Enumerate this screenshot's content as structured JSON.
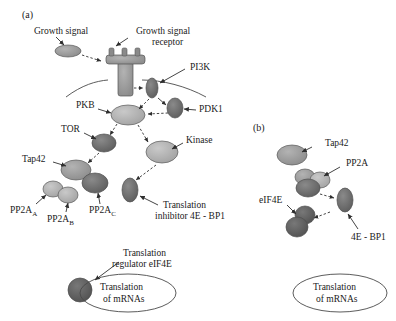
{
  "figure": {
    "type": "signaling-pathway-diagram",
    "panels": [
      {
        "id": "a",
        "label": "(a)",
        "title": "TOR / PKB signalling pathway in mammalian cells",
        "nodes": [
          {
            "name": "growth-signal",
            "label": "Growth signal",
            "shape": "ellipse",
            "color": "#9e9e9e"
          },
          {
            "name": "growth-signal-receptor",
            "label": "Growth signal\nreceptor",
            "shape": "receptor",
            "color": "#8c8c8c"
          },
          {
            "name": "pi3k",
            "label": "PI3K",
            "shape": "ellipse",
            "color": "#6e6e6e"
          },
          {
            "name": "pkb",
            "label": "PKB",
            "shape": "ellipse",
            "color": "#a8a8a8"
          },
          {
            "name": "pdk1",
            "label": "PDK1",
            "shape": "ellipse",
            "color": "#7a7a7a"
          },
          {
            "name": "tor",
            "label": "TOR",
            "shape": "ellipse",
            "color": "#6b6b6b"
          },
          {
            "name": "kinase",
            "label": "Kinase",
            "shape": "ellipse",
            "color": "#b0b0b0"
          },
          {
            "name": "tap42",
            "label": "Tap42",
            "shape": "ellipse",
            "color": "#9a9a9a"
          },
          {
            "name": "pp2a-a",
            "label": "PP2A",
            "subscript": "A",
            "shape": "ellipse",
            "color": "#a5a5a5"
          },
          {
            "name": "pp2a-b",
            "label": "PP2A",
            "subscript": "B",
            "shape": "ellipse",
            "color": "#a5a5a5"
          },
          {
            "name": "pp2a-c",
            "label": "PP2A",
            "subscript": "C",
            "shape": "ellipse",
            "color": "#6f6f6f"
          },
          {
            "name": "4e-bp1",
            "label": "Translation\ninhibitor 4E - BP1",
            "shape": "ellipse",
            "color": "#6a6a6a"
          },
          {
            "name": "eif4e",
            "label": "Translation\nregulator eIF4E",
            "shape": "circle",
            "color": "#5e5e5e"
          },
          {
            "name": "translation-outcome",
            "label": "Translation\nof mRNAs",
            "shape": "ellipse-outline",
            "color": "#ffffff"
          }
        ],
        "labels": {
          "growth_signal": "Growth signal",
          "growth_signal_receptor_line1": "Growth signal",
          "growth_signal_receptor_line2": "receptor",
          "pi3k": "PI3K",
          "pkb": "PKB",
          "pdk1": "PDK1",
          "tor": "TOR",
          "kinase": "Kinase",
          "tap42": "Tap42",
          "pp2a_a_base": "PP2A",
          "pp2a_a_sub": "A",
          "pp2a_b_base": "PP2A",
          "pp2a_b_sub": "B",
          "pp2a_c_base": "PP2A",
          "pp2a_c_sub": "C",
          "inhibitor_line1": "Translation",
          "inhibitor_line2": "inhibitor 4E - BP1",
          "regulator_line1": "Translation",
          "regulator_line2": "regulator eIF4E",
          "outcome_line1": "Translation",
          "outcome_line2": "of mRNAs"
        }
      },
      {
        "id": "b",
        "label": "(b)",
        "title": "Tap42 / PP2A dephosphorylation of 4E-BP1",
        "labels": {
          "tap42": "Tap42",
          "pp2a": "PP2A",
          "eif4e": "eIF4E",
          "4e_bp1": "4E - BP1",
          "outcome_line1": "Translation",
          "outcome_line2": "of mRNAs"
        },
        "nodes": [
          {
            "name": "tap42",
            "label": "Tap42",
            "shape": "ellipse",
            "color": "#9a9a9a"
          },
          {
            "name": "pp2a",
            "label": "PP2A",
            "shape": "cluster",
            "color": "#8f8f8f"
          },
          {
            "name": "eif4e",
            "label": "eIF4E",
            "shape": "ellipse",
            "color": "#5e5e5e"
          },
          {
            "name": "4e-bp1",
            "label": "4E - BP1",
            "shape": "ellipse",
            "color": "#6a6a6a"
          },
          {
            "name": "translation-outcome",
            "label": "Translation\nof mRNAs",
            "shape": "ellipse-outline",
            "color": "#ffffff"
          }
        ]
      }
    ],
    "colors": {
      "background": "#ffffff",
      "stroke": "#3a3a3a",
      "text": "#1a1a1a",
      "light_gray": "#b0b0b0",
      "mid_gray": "#9a9a9a",
      "dark_gray": "#6a6a6a"
    },
    "arrow_styles": [
      "solid",
      "dashed"
    ]
  }
}
